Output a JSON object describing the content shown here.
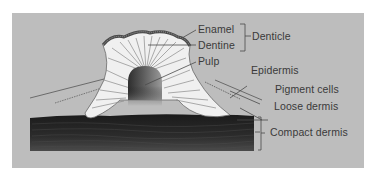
{
  "figure": {
    "colors": {
      "page_background": "#ffffff",
      "panel_background": "#bdbdbd",
      "compact_dermis": "#262626",
      "denticle_body": "#efefef",
      "enamel": "#5a5a5a",
      "pulp": "#4a4a4a",
      "label_text": "#3a3a3a"
    }
  },
  "labels": {
    "enamel": "Enamel",
    "dentine": "Dentine",
    "pulp": "Pulp",
    "denticle": "Denticle",
    "epidermis": "Epidermis",
    "pigment_cells": "Pigment cells",
    "loose_dermis": "Loose dermis",
    "compact_dermis": "Compact dermis"
  },
  "groups": {
    "denticle_bracket_covers": [
      "Enamel",
      "Dentine"
    ],
    "compact_dermis_bracket": true
  }
}
